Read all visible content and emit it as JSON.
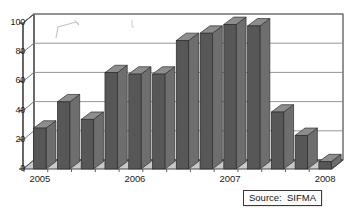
{
  "chart_data": {
    "type": "bar",
    "title": "",
    "subtitle": "",
    "xlabel": "",
    "ylabel": "",
    "ylim": [
      0,
      100
    ],
    "yticks": [
      0,
      20,
      40,
      60,
      80,
      100
    ],
    "ytick_labels": [
      "0",
      "20",
      "40",
      "60",
      "80",
      "100"
    ],
    "grid": true,
    "grid_axis": "y",
    "legend": false,
    "legend_position": "none",
    "style": "3d-column",
    "bar_color": "#575757",
    "bar_top_color": "#8d8d8d",
    "bar_side_color": "#6e6e6e",
    "plot_background": "#ffffff",
    "floor_color": "#c9c9c9",
    "axis_color": "#333333",
    "grid_color": "#8a8a8a",
    "x_axis_group_labels": [
      "2005",
      "2006",
      "2007",
      "2008"
    ],
    "categories": [
      "Q1",
      "Q2",
      "Q3",
      "Q4",
      "Q1",
      "Q2",
      "Q3",
      "Q4",
      "Q1",
      "Q2",
      "Q3",
      "Q4",
      "Q1"
    ],
    "values": [
      28,
      46,
      34,
      66,
      65,
      65,
      88,
      93,
      99,
      98,
      39,
      23,
      5
    ],
    "series": [
      {
        "name": "Issuance",
        "values": [
          28,
          46,
          34,
          66,
          65,
          65,
          88,
          93,
          99,
          98,
          39,
          23,
          5
        ]
      }
    ]
  },
  "annotations": {
    "source": {
      "label": "Source:  SIFMA"
    }
  }
}
